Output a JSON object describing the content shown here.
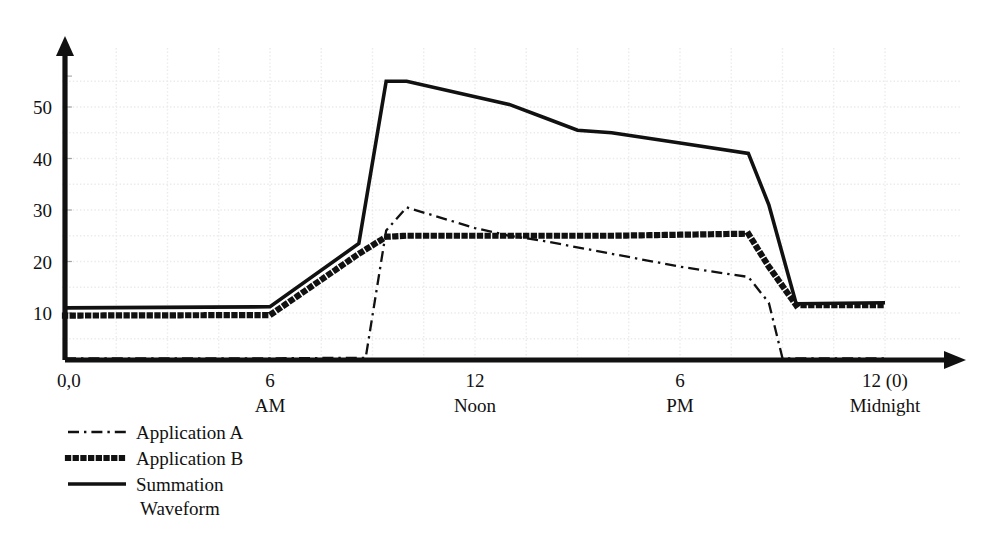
{
  "chart_data": {
    "type": "line",
    "title": "",
    "subtitle": "",
    "xlabel": "",
    "ylabel": "",
    "xlim": [
      0,
      24
    ],
    "ylim": [
      0,
      58
    ],
    "grid": true,
    "grid_style": "faint dotted background grid",
    "legend_position": "below-left",
    "y_ticks": [
      10,
      20,
      30,
      40,
      50
    ],
    "y_tick_labels": [
      "10",
      "20",
      "30",
      "40",
      "50"
    ],
    "x_ticks": [
      0,
      6,
      12,
      18,
      24
    ],
    "x_tick_labels": [
      "0,0",
      "6",
      "12",
      "6",
      "12 (0)"
    ],
    "x_tick_sublabels": [
      "",
      "AM",
      "Noon",
      "PM",
      "Midnight"
    ],
    "series": [
      {
        "name": "Application A",
        "style": "dash-dot",
        "x": [
          0,
          6,
          8.6,
          8.8,
          9.4,
          10.0,
          12.0,
          13.0,
          14.0,
          16.0,
          18.0,
          20.0,
          20.6,
          21.0,
          24.0
        ],
        "values": [
          1.2,
          1.2,
          1.3,
          1.3,
          26.0,
          30.5,
          26.5,
          25.0,
          24.0,
          21.5,
          19.0,
          17.0,
          12.0,
          1.2,
          1.2
        ]
      },
      {
        "name": "Application B",
        "style": "dotted",
        "x": [
          0,
          6,
          8.6,
          9.4,
          10.0,
          12.0,
          14.0,
          16.0,
          18.0,
          20.0,
          20.6,
          21.4,
          24.0
        ],
        "values": [
          9.5,
          9.6,
          21.5,
          24.8,
          25.0,
          25.0,
          25.0,
          25.0,
          25.2,
          25.4,
          19.0,
          11.5,
          11.5
        ]
      },
      {
        "name": "Summation Waveform",
        "style": "solid",
        "x": [
          0,
          6,
          8.6,
          9.4,
          10.0,
          12.0,
          13.0,
          14.0,
          15.0,
          16.0,
          18.0,
          20.0,
          20.6,
          21.4,
          24.0
        ],
        "values": [
          11.0,
          11.2,
          23.5,
          55.0,
          55.0,
          52.0,
          50.5,
          48.0,
          45.5,
          45.0,
          43.0,
          41.0,
          31.0,
          11.8,
          12.0
        ]
      }
    ]
  },
  "legend": {
    "items": [
      {
        "label": "Application A",
        "style": "dash-dot"
      },
      {
        "label": "Application B",
        "style": "dotted"
      },
      {
        "label": "Summation",
        "label2": "Waveform",
        "style": "solid"
      }
    ]
  },
  "colors": {
    "ink": "#111111",
    "grid": "#eceaea",
    "background": "#ffffff"
  }
}
